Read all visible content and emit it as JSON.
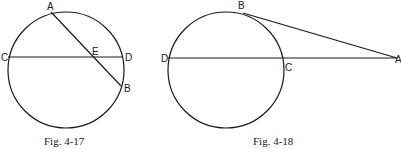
{
  "figures": [
    {
      "caption": "Fig. 4-17",
      "labels": {
        "A": "A",
        "B": "B",
        "C": "C",
        "D": "D",
        "E": "E"
      },
      "description": "Circle with chord CD and chord AB intersecting at E"
    },
    {
      "caption": "Fig. 4-18",
      "labels": {
        "A": "A",
        "B": "B",
        "C": "C",
        "D": "D"
      },
      "description": "Circle with tangent AB from external point A and secant ACD"
    }
  ]
}
